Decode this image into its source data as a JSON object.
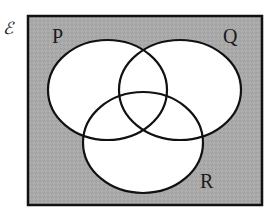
{
  "diagram": {
    "type": "venn",
    "universal_set_symbol": "ℰ",
    "sets": [
      {
        "id": "P",
        "label": "P"
      },
      {
        "id": "Q",
        "label": "Q"
      },
      {
        "id": "R",
        "label": "R"
      }
    ],
    "shaded_region": "complement of (P ∪ Q ∪ R)",
    "colors": {
      "shading": "#a9a9a9",
      "set_fill": "#ffffff",
      "outline": "#111111"
    }
  }
}
